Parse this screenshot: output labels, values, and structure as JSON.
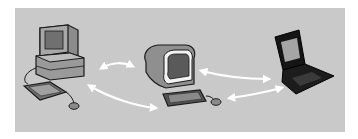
{
  "diagram": {
    "type": "network-illustration",
    "background_color": "#c9c9c9",
    "nodes": [
      {
        "id": "desktop",
        "label": "desktop-computer",
        "description": "Desktop PC with CRT monitor, system unit, keyboard and mouse"
      },
      {
        "id": "terminal",
        "label": "all-in-one-computer",
        "description": "Rounded all-in-one computer with keyboard and mouse"
      },
      {
        "id": "laptop",
        "label": "laptop-computer",
        "description": "Black laptop with open screen"
      }
    ],
    "connections": [
      {
        "from": "desktop",
        "to": "terminal",
        "direction": "bidirectional"
      },
      {
        "from": "desktop",
        "to": "terminal-keyboard",
        "direction": "bidirectional"
      },
      {
        "from": "terminal",
        "to": "laptop",
        "direction": "bidirectional"
      },
      {
        "from": "terminal-mouse",
        "to": "laptop",
        "direction": "bidirectional"
      }
    ],
    "arrow_color": "#ffffff"
  }
}
